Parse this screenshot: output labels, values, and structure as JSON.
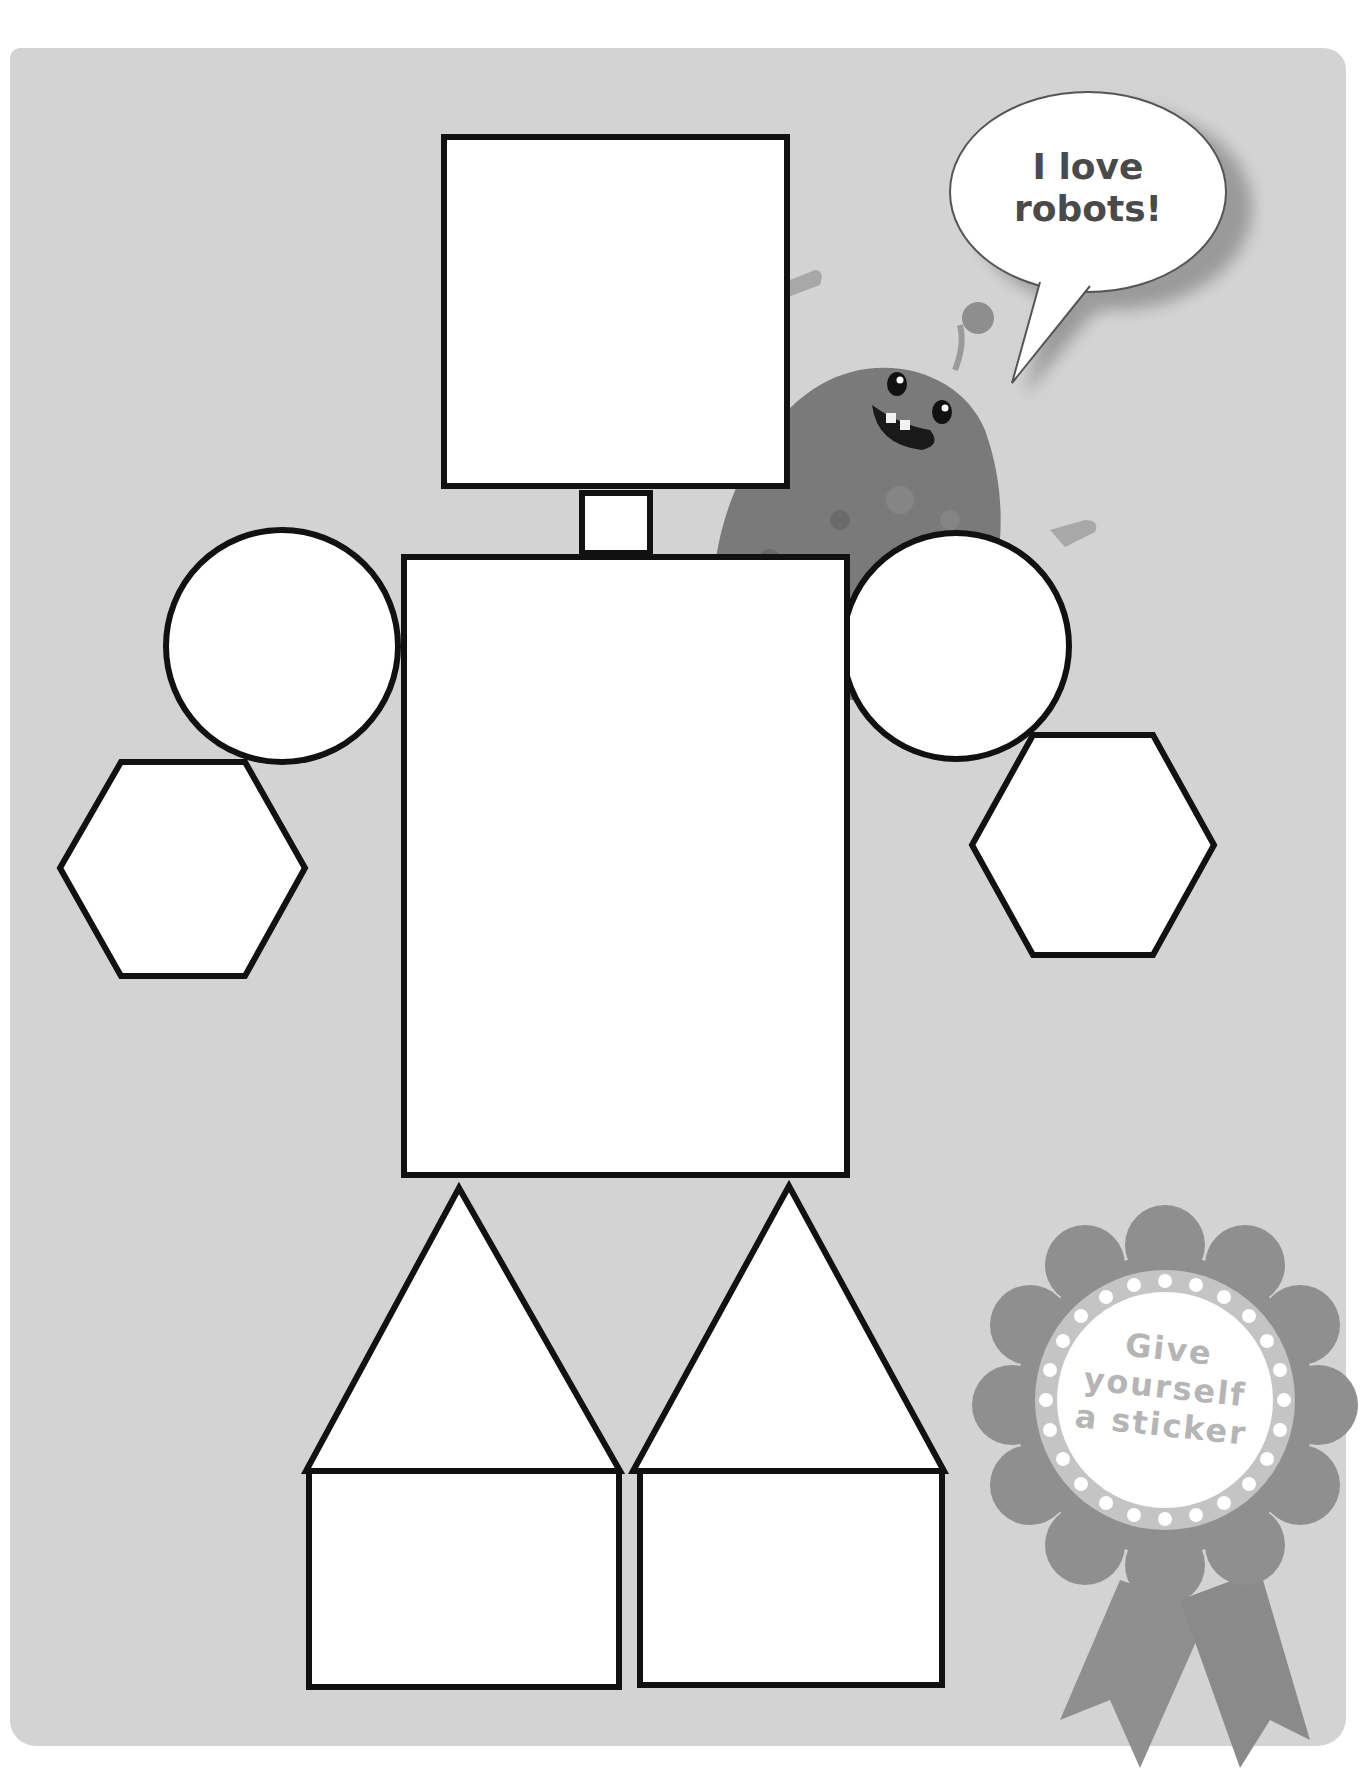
{
  "page": {
    "header_fragment": "",
    "background_color": "#ffffff",
    "panel_color": "#d3d3d3"
  },
  "robot": {
    "description": "Robot made of shapes",
    "outline_color": "#111111",
    "fill_color": "#ffffff",
    "parts": [
      {
        "name": "head",
        "shape": "square"
      },
      {
        "name": "neck",
        "shape": "rectangle"
      },
      {
        "name": "body",
        "shape": "rectangle"
      },
      {
        "name": "left-shoulder",
        "shape": "circle"
      },
      {
        "name": "right-shoulder",
        "shape": "circle"
      },
      {
        "name": "left-hand",
        "shape": "hexagon"
      },
      {
        "name": "right-hand",
        "shape": "hexagon"
      },
      {
        "name": "left-leg",
        "shape": "triangle"
      },
      {
        "name": "right-leg",
        "shape": "triangle"
      },
      {
        "name": "left-foot",
        "shape": "rectangle"
      },
      {
        "name": "right-foot",
        "shape": "rectangle"
      }
    ]
  },
  "speech_bubble": {
    "line1": "I love",
    "line2": "robots!"
  },
  "sticker": {
    "line1": "Give",
    "line2": "yourself",
    "line3": "a sticker",
    "rosette_color": "#8f8f8f",
    "ring_color": "#c4c4c4"
  },
  "character": {
    "name": "monster",
    "color": "#7a7a7a"
  }
}
